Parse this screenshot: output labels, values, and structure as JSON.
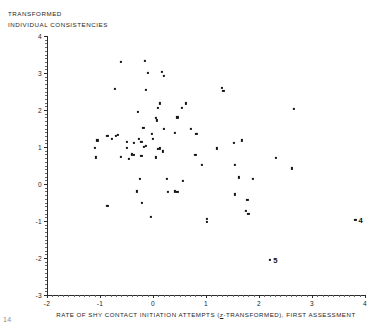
{
  "axes": {
    "y_caption_line1": "TRANSFORMED",
    "y_caption_line2": "INDIVIDUAL CONSISTENCIES",
    "x_caption_pre": "RATE OF SHY CONTACT INITIATION ATTEMPTS (",
    "x_caption_italic": "z",
    "x_caption_post": "-TRANSFORMED), FIRST ASSESSMENT",
    "y_ticks": [
      "4",
      "3",
      "2",
      "1",
      "0",
      "-1",
      "-2",
      "-3"
    ],
    "x_ticks": [
      "-2",
      "-1",
      "0",
      "1",
      "2",
      "3",
      "4"
    ]
  },
  "page_artifact": "14",
  "chart_data": {
    "type": "scatter",
    "title": "",
    "xlabel": "RATE OF SHY CONTACT INITIATION ATTEMPTS (z-TRANSFORMED), FIRST ASSESSMENT",
    "ylabel": "TRANSFORMED INDIVIDUAL CONSISTENCIES",
    "xlim": [
      -2,
      4
    ],
    "ylim": [
      -3,
      4
    ],
    "xticks": [
      -2,
      -1,
      0,
      1,
      2,
      3,
      4
    ],
    "yticks": [
      -3,
      -2,
      -1,
      0,
      1,
      2,
      3,
      4
    ],
    "grid": false,
    "legend": false,
    "marker": "square-dot",
    "marker_color": "#141414",
    "points": [
      {
        "x": -0.61,
        "y": 3.29
      },
      {
        "x": -0.16,
        "y": 3.32
      },
      {
        "x": -0.09,
        "y": 3.0
      },
      {
        "x": 0.17,
        "y": 3.02
      },
      {
        "x": 0.2,
        "y": 2.92
      },
      {
        "x": -0.72,
        "y": 2.58
      },
      {
        "x": -0.13,
        "y": 2.54
      },
      {
        "x": 1.3,
        "y": 2.6
      },
      {
        "x": 1.33,
        "y": 2.52
      },
      {
        "x": -0.29,
        "y": 1.95
      },
      {
        "x": 0.09,
        "y": 2.06
      },
      {
        "x": 0.13,
        "y": 2.18
      },
      {
        "x": 0.54,
        "y": 2.05
      },
      {
        "x": 0.62,
        "y": 2.18
      },
      {
        "x": 0.05,
        "y": 1.78
      },
      {
        "x": 0.08,
        "y": 1.72
      },
      {
        "x": 0.46,
        "y": 1.8
      },
      {
        "x": -0.18,
        "y": 1.52
      },
      {
        "x": 0.2,
        "y": 1.5
      },
      {
        "x": 0.72,
        "y": 1.5
      },
      {
        "x": 2.66,
        "y": 2.02
      },
      {
        "x": -0.02,
        "y": 1.36
      },
      {
        "x": 0.42,
        "y": 1.38
      },
      {
        "x": 0.82,
        "y": 1.35
      },
      {
        "x": -0.86,
        "y": 1.29
      },
      {
        "x": -0.78,
        "y": 1.22
      },
      {
        "x": -0.7,
        "y": 1.3
      },
      {
        "x": -0.66,
        "y": 1.33
      },
      {
        "x": -1.05,
        "y": 1.18
      },
      {
        "x": -0.49,
        "y": 1.14
      },
      {
        "x": -0.36,
        "y": 1.11
      },
      {
        "x": -0.26,
        "y": 1.22
      },
      {
        "x": -0.22,
        "y": 1.13
      },
      {
        "x": 0.0,
        "y": 1.22
      },
      {
        "x": -1.1,
        "y": 0.98
      },
      {
        "x": -0.5,
        "y": 0.98
      },
      {
        "x": -0.17,
        "y": 1.0
      },
      {
        "x": -0.13,
        "y": 1.02
      },
      {
        "x": 0.1,
        "y": 0.94
      },
      {
        "x": 0.13,
        "y": 0.96
      },
      {
        "x": 0.18,
        "y": 0.88
      },
      {
        "x": 1.2,
        "y": 0.96
      },
      {
        "x": 1.52,
        "y": 1.12
      },
      {
        "x": 1.68,
        "y": 1.18
      },
      {
        "x": -1.08,
        "y": 0.72
      },
      {
        "x": -0.6,
        "y": 0.74
      },
      {
        "x": -0.45,
        "y": 0.68
      },
      {
        "x": -0.4,
        "y": 0.8
      },
      {
        "x": -0.36,
        "y": 0.78
      },
      {
        "x": -0.22,
        "y": 0.76
      },
      {
        "x": 0.06,
        "y": 0.72
      },
      {
        "x": 0.8,
        "y": 0.78
      },
      {
        "x": 2.32,
        "y": 0.7
      },
      {
        "x": 0.92,
        "y": 0.52
      },
      {
        "x": 1.54,
        "y": 0.52
      },
      {
        "x": 2.62,
        "y": 0.42
      },
      {
        "x": -0.24,
        "y": 0.14
      },
      {
        "x": 0.26,
        "y": 0.14
      },
      {
        "x": 0.56,
        "y": 0.08
      },
      {
        "x": 1.62,
        "y": 0.18
      },
      {
        "x": 1.88,
        "y": 0.14
      },
      {
        "x": -0.3,
        "y": -0.2
      },
      {
        "x": 0.28,
        "y": -0.22
      },
      {
        "x": 0.42,
        "y": -0.2
      },
      {
        "x": 0.46,
        "y": -0.22
      },
      {
        "x": 1.54,
        "y": -0.28
      },
      {
        "x": 1.78,
        "y": -0.42
      },
      {
        "x": -0.86,
        "y": -0.6
      },
      {
        "x": -0.21,
        "y": -0.5
      },
      {
        "x": 1.76,
        "y": -0.72
      },
      {
        "x": 1.8,
        "y": -0.8
      },
      {
        "x": -0.04,
        "y": -0.9
      },
      {
        "x": 1.01,
        "y": -0.94
      },
      {
        "x": 1.02,
        "y": -1.02
      },
      {
        "x": 3.82,
        "y": -0.98,
        "label": "4"
      },
      {
        "x": 2.21,
        "y": -2.05,
        "label": "5"
      }
    ]
  }
}
